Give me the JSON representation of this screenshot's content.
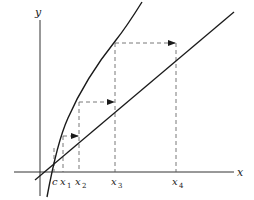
{
  "diagram": {
    "type": "fixed-point-iteration",
    "axes": {
      "x_label": "x",
      "y_label": "y"
    },
    "curves": [
      {
        "name": "y = g(x)",
        "kind": "concave curve"
      },
      {
        "name": "y = x",
        "kind": "straight line"
      }
    ],
    "fixed_point_label": "c",
    "iterates": [
      {
        "base": "x",
        "sub": "1"
      },
      {
        "base": "x",
        "sub": "2"
      },
      {
        "base": "x",
        "sub": "3"
      },
      {
        "base": "x",
        "sub": "4"
      }
    ],
    "colors": {
      "stroke": "#1a1a1a",
      "dashed": "#555555",
      "background": "#ffffff"
    }
  }
}
